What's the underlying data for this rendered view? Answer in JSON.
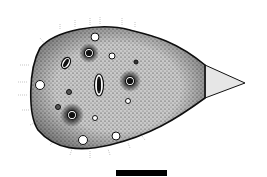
{
  "figure": {
    "scale_bar": {
      "present": true,
      "color": "#000000"
    },
    "colors": {
      "background": "#ffffff",
      "ink": "#111111",
      "body_fill": "#bdbdbd",
      "tail_fill": "#e6e6e6"
    }
  }
}
